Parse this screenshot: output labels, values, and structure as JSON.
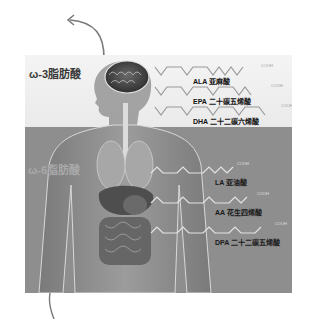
{
  "omega3": {
    "label": "ω-3脂肪酸",
    "acids": [
      {
        "abbr": "ALA",
        "name": "亚麻酸",
        "label": "ALA 亚麻酸",
        "terminal": "COOH"
      },
      {
        "abbr": "EPA",
        "name": "二十碳五烯酸",
        "label": "EPA 二十碳五烯酸",
        "terminal": "COOH"
      },
      {
        "abbr": "DHA",
        "name": "二十二碳六烯酸",
        "label": "DHA 二十二碳六烯酸",
        "terminal": "COOH"
      }
    ]
  },
  "omega6": {
    "label": "ω-6脂肪酸",
    "acids": [
      {
        "abbr": "LA",
        "name": "亚油酸",
        "label": "LA 亚油酸",
        "terminal": "COOH"
      },
      {
        "abbr": "AA",
        "name": "花生四烯酸",
        "label": "AA 花生四烯酸",
        "terminal": "COOH"
      },
      {
        "abbr": "DPA",
        "name": "二十二碳五烯酸",
        "label": "DPA 二十二碳五烯酸",
        "terminal": "COOH"
      }
    ]
  },
  "colors": {
    "top_bg": "#eeeeee",
    "bottom_bg": "#8e8e8e",
    "arrow": "#777777"
  }
}
